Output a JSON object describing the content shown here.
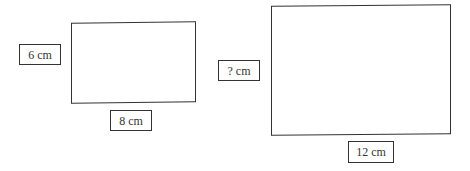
{
  "diagram": {
    "type": "similar-rectangles",
    "shapes": [
      {
        "name": "small-rectangle",
        "height_label": "6 cm",
        "width_label": "8 cm"
      },
      {
        "name": "large-rectangle",
        "height_label": "? cm",
        "width_label": "12 cm"
      }
    ],
    "colors": {
      "stroke": "#333333",
      "background": "#ffffff"
    }
  }
}
